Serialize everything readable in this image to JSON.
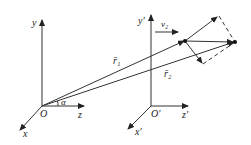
{
  "diagram": {
    "frame_left": {
      "origin_label": "O",
      "y_label": "y",
      "z_label": "z",
      "x_label": "x",
      "angle_label": "α"
    },
    "frame_right": {
      "origin_label": "O'",
      "y_label": "y'",
      "z_label": "z'",
      "x_label": "x'"
    },
    "vectors": {
      "r1_label": "r̄₁",
      "r2_label": "r̄₂",
      "v2_label": "v₂"
    },
    "colors": {
      "line": "#333333",
      "background": "#ffffff"
    }
  }
}
